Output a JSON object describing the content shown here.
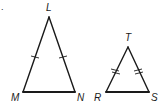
{
  "figure": {
    "item_marker": ".",
    "triangles": [
      {
        "name": "LMN",
        "vertices": {
          "L": {
            "x": 49,
            "y": 17,
            "label": "L",
            "lx": 46,
            "ly": 11
          },
          "M": {
            "x": 23,
            "y": 92,
            "label": "M",
            "lx": 11,
            "ly": 101
          },
          "N": {
            "x": 75,
            "y": 92,
            "label": "N",
            "lx": 77,
            "ly": 101
          }
        },
        "congruent_sides": [
          "LM",
          "LN"
        ],
        "tick_count": 1
      },
      {
        "name": "TRS",
        "vertices": {
          "T": {
            "x": 128,
            "y": 47,
            "label": "T",
            "lx": 125,
            "ly": 41
          },
          "R": {
            "x": 106,
            "y": 92,
            "label": "R",
            "lx": 94,
            "ly": 101
          },
          "S": {
            "x": 149,
            "y": 92,
            "label": "S",
            "lx": 151,
            "ly": 101
          }
        },
        "congruent_sides": [
          "TR",
          "TS"
        ],
        "tick_count": 2
      }
    ]
  }
}
